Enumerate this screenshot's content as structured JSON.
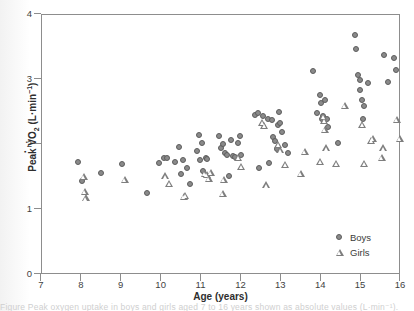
{
  "figure": {
    "background": "#ffffff",
    "frame_color": "#8d8d8d",
    "caption_partial": "Figure      Peak oxygen uptake in boys and girls aged 7 to 16 years shown as absolute values (L·min⁻¹)."
  },
  "axes": {
    "x_label": "Age (years)",
    "y_label_prefix": "Peak V̇O",
    "y_label_sub": "2",
    "y_label_units_open": " (L",
    "y_label_mid": "·min",
    "y_label_sup": "−1",
    "y_label_close": ")",
    "x_ticks": [
      "7",
      "8",
      "9",
      "10",
      "11",
      "12",
      "13",
      "14",
      "15",
      "16"
    ],
    "y_ticks": [
      "4",
      "3",
      "2",
      "1",
      "0"
    ],
    "xlim": [
      7,
      16
    ],
    "ylim": [
      0,
      4
    ]
  },
  "legend": {
    "position": "bottom-right",
    "entries": [
      {
        "label": "Boys",
        "marker": "circle",
        "color": "#8a8a8a"
      },
      {
        "label": "Girls",
        "marker": "triangle",
        "color": "#7e7e7e"
      }
    ]
  },
  "chart_data": {
    "type": "scatter",
    "title": "",
    "xlabel": "Age (years)",
    "ylabel": "Peak VO2 (L·min-1)",
    "xlim": [
      7,
      16
    ],
    "ylim": [
      0,
      4
    ],
    "grid": false,
    "legend_position": "bottom-right",
    "series": [
      {
        "name": "Boys",
        "marker": "circle",
        "color": "#8a8a8a",
        "points": [
          [
            7.93,
            1.72
          ],
          [
            8.03,
            1.42
          ],
          [
            8.52,
            1.54
          ],
          [
            9.05,
            1.69
          ],
          [
            9.68,
            1.24
          ],
          [
            9.98,
            1.7
          ],
          [
            10.1,
            1.78
          ],
          [
            10.18,
            1.77
          ],
          [
            10.38,
            1.72
          ],
          [
            10.46,
            1.94
          ],
          [
            10.52,
            1.53
          ],
          [
            10.58,
            1.75
          ],
          [
            10.68,
            1.62
          ],
          [
            10.74,
            1.38
          ],
          [
            10.92,
            1.89
          ],
          [
            10.98,
            2.13
          ],
          [
            11.0,
            1.75
          ],
          [
            11.05,
            2.01
          ],
          [
            11.08,
            1.57
          ],
          [
            11.15,
            1.78
          ],
          [
            11.18,
            1.76
          ],
          [
            11.47,
            2.12
          ],
          [
            11.52,
            1.93
          ],
          [
            11.58,
            1.99
          ],
          [
            11.62,
            1.86
          ],
          [
            11.68,
            1.83
          ],
          [
            11.72,
            1.5
          ],
          [
            11.78,
            2.05
          ],
          [
            11.82,
            1.81
          ],
          [
            11.88,
            1.79
          ],
          [
            11.95,
            2.01
          ],
          [
            12.0,
            2.12
          ],
          [
            12.03,
            1.82
          ],
          [
            12.38,
            2.44
          ],
          [
            12.45,
            2.47
          ],
          [
            12.48,
            1.62
          ],
          [
            12.58,
            2.43
          ],
          [
            12.7,
            2.38
          ],
          [
            12.74,
            1.7
          ],
          [
            12.8,
            2.36
          ],
          [
            12.84,
            2.1
          ],
          [
            12.88,
            2.04
          ],
          [
            12.92,
            1.92
          ],
          [
            12.95,
            2.28
          ],
          [
            12.98,
            2.48
          ],
          [
            13.0,
            2.31
          ],
          [
            13.05,
            2.17
          ],
          [
            13.12,
            1.98
          ],
          [
            13.2,
            1.86
          ],
          [
            13.82,
            3.12
          ],
          [
            13.92,
            2.47
          ],
          [
            14.0,
            2.74
          ],
          [
            14.02,
            2.62
          ],
          [
            14.05,
            2.38
          ],
          [
            14.08,
            2.42
          ],
          [
            14.12,
            2.67
          ],
          [
            14.18,
            2.38
          ],
          [
            14.22,
            2.26
          ],
          [
            14.45,
            2.01
          ],
          [
            14.88,
            3.67
          ],
          [
            14.92,
            3.46
          ],
          [
            14.95,
            3.05
          ],
          [
            15.0,
            2.97
          ],
          [
            15.02,
            2.83
          ],
          [
            15.05,
            2.67
          ],
          [
            15.08,
            2.38
          ],
          [
            15.12,
            2.57
          ],
          [
            15.22,
            2.93
          ],
          [
            15.62,
            3.36
          ],
          [
            15.72,
            2.95
          ],
          [
            15.85,
            3.32
          ],
          [
            15.92,
            3.13
          ]
        ]
      },
      {
        "name": "Girls",
        "marker": "triangle",
        "color": "#7e7e7e",
        "points": [
          [
            7.98,
            1.5
          ],
          [
            8.0,
            1.27
          ],
          [
            8.02,
            1.17
          ],
          [
            9.0,
            1.46
          ],
          [
            10.02,
            1.51
          ],
          [
            10.12,
            1.4
          ],
          [
            10.48,
            1.19
          ],
          [
            10.52,
            1.21
          ],
          [
            11.0,
            1.55
          ],
          [
            11.05,
            1.53
          ],
          [
            11.1,
            1.47
          ],
          [
            11.15,
            1.56
          ],
          [
            11.45,
            1.24
          ],
          [
            11.48,
            1.46
          ],
          [
            11.85,
            1.79
          ],
          [
            11.92,
            1.66
          ],
          [
            12.45,
            2.33
          ],
          [
            12.5,
            2.28
          ],
          [
            12.55,
            1.37
          ],
          [
            12.85,
            2.0
          ],
          [
            12.9,
            1.91
          ],
          [
            13.02,
            1.68
          ],
          [
            13.42,
            1.55
          ],
          [
            13.52,
            1.88
          ],
          [
            13.98,
            2.42
          ],
          [
            14.0,
            2.36
          ],
          [
            14.02,
            2.22
          ],
          [
            14.05,
            1.94
          ],
          [
            13.9,
            1.73
          ],
          [
            14.3,
            1.7
          ],
          [
            14.52,
            2.6
          ],
          [
            14.95,
            2.3
          ],
          [
            15.0,
            1.7
          ],
          [
            15.18,
            2.06
          ],
          [
            15.22,
            2.09
          ],
          [
            15.45,
            1.8
          ],
          [
            15.48,
            1.94
          ],
          [
            15.82,
            2.38
          ],
          [
            15.9,
            2.09
          ]
        ]
      }
    ]
  }
}
